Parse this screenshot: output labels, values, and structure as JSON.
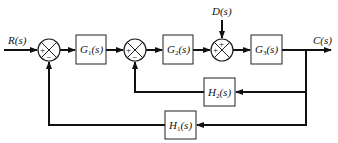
{
  "diagram": {
    "type": "control-system-block-diagram",
    "signals": {
      "input": "R(s)",
      "output": "C(s)",
      "disturbance": "D(s)"
    },
    "blocks": [
      {
        "id": "G1",
        "name": "G",
        "sub": "1",
        "arg": "(s)"
      },
      {
        "id": "G2",
        "name": "G",
        "sub": "2",
        "arg": "(s)"
      },
      {
        "id": "G3",
        "name": "G",
        "sub": "3",
        "arg": "(s)"
      },
      {
        "id": "H2",
        "name": "H",
        "sub": "2",
        "arg": "(s)"
      },
      {
        "id": "H1",
        "name": "H",
        "sub": "1",
        "arg": "(s)"
      }
    ],
    "summing_junctions": [
      {
        "id": "S1",
        "signs": {
          "left": "+",
          "bottom": "−"
        }
      },
      {
        "id": "S2",
        "signs": {
          "left": "+",
          "bottom": "−"
        }
      },
      {
        "id": "S3",
        "signs": {
          "left": "+",
          "top": "+"
        }
      }
    ],
    "colors": {
      "line": "#111111",
      "background": "#ffffff"
    }
  }
}
